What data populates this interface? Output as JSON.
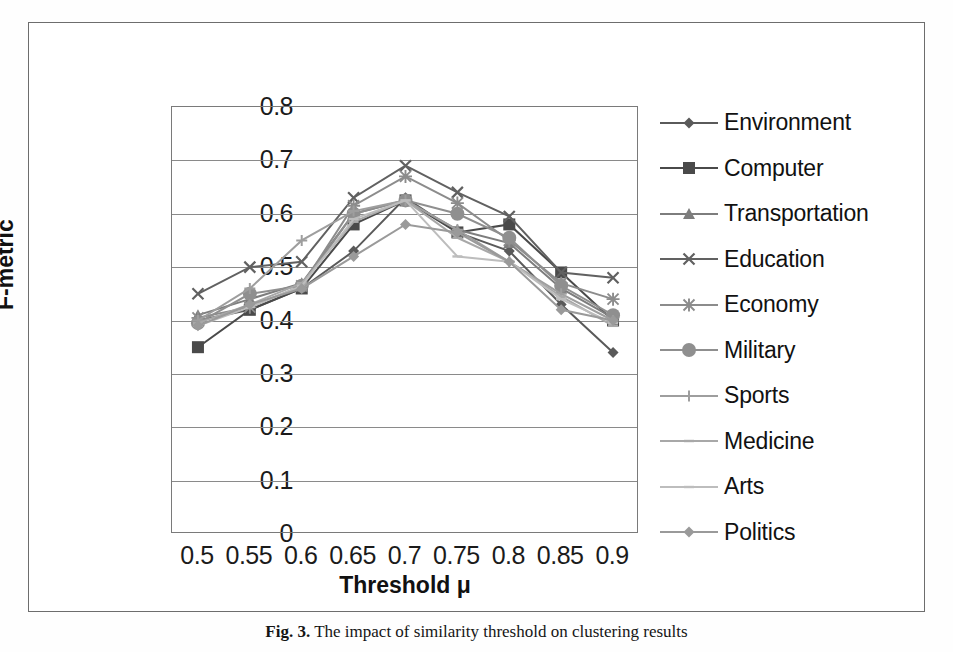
{
  "figure": {
    "caption_prefix": "Fig. 3.",
    "caption_text": "The impact of similarity threshold  on clustering results"
  },
  "chart_data": {
    "type": "line",
    "title": "",
    "xlabel": "Threshold μ",
    "ylabel": "F-metric",
    "categories": [
      "0.5",
      "0.55",
      "0.6",
      "0.65",
      "0.7",
      "0.75",
      "0.8",
      "0.85",
      "0.9"
    ],
    "x": [
      0.5,
      0.55,
      0.6,
      0.65,
      0.7,
      0.75,
      0.8,
      0.85,
      0.9
    ],
    "ylim": [
      0,
      0.8
    ],
    "yticks": [
      "0",
      "0.1",
      "0.2",
      "0.3",
      "0.4",
      "0.5",
      "0.6",
      "0.7",
      "0.8"
    ],
    "ytick_values": [
      0,
      0.1,
      0.2,
      0.3,
      0.4,
      0.5,
      0.6,
      0.7,
      0.8
    ],
    "grid": true,
    "legend_position": "right",
    "series": [
      {
        "name": "Environment",
        "marker": "diamond",
        "color": "#5a5a5a",
        "values": [
          0.4,
          0.42,
          0.46,
          0.53,
          0.63,
          0.565,
          0.53,
          0.43,
          0.34
        ]
      },
      {
        "name": "Computer",
        "marker": "square",
        "color": "#4a4a4a",
        "values": [
          0.35,
          0.42,
          0.46,
          0.58,
          0.625,
          0.565,
          0.58,
          0.49,
          0.4
        ]
      },
      {
        "name": "Transportation",
        "marker": "triangle",
        "color": "#7d7d7d",
        "values": [
          0.41,
          0.44,
          0.47,
          0.6,
          0.625,
          0.57,
          0.545,
          0.46,
          0.405
        ]
      },
      {
        "name": "Education",
        "marker": "cross",
        "color": "#616161",
        "values": [
          0.45,
          0.5,
          0.51,
          0.63,
          0.69,
          0.64,
          0.595,
          0.49,
          0.48
        ]
      },
      {
        "name": "Economy",
        "marker": "star",
        "color": "#8c8c8c",
        "values": [
          0.405,
          0.425,
          0.465,
          0.615,
          0.67,
          0.62,
          0.55,
          0.47,
          0.44
        ]
      },
      {
        "name": "Military",
        "marker": "circle",
        "color": "#8f8f8f",
        "values": [
          0.395,
          0.45,
          0.465,
          0.6,
          0.625,
          0.6,
          0.555,
          0.465,
          0.41
        ]
      },
      {
        "name": "Sports",
        "marker": "plus",
        "color": "#9e9e9e",
        "values": [
          0.4,
          0.46,
          0.55,
          0.605,
          0.625,
          0.57,
          0.51,
          0.45,
          0.4
        ]
      },
      {
        "name": "Medicine",
        "marker": "dash",
        "color": "#a8a8a8",
        "values": [
          0.395,
          0.43,
          0.47,
          0.585,
          0.625,
          0.555,
          0.51,
          0.445,
          0.39
        ]
      },
      {
        "name": "Arts",
        "marker": "dash",
        "color": "#bdbdbd",
        "values": [
          0.39,
          0.425,
          0.465,
          0.59,
          0.625,
          0.52,
          0.51,
          0.44,
          0.395
        ]
      },
      {
        "name": "Politics",
        "marker": "diamond",
        "color": "#9a9a9a",
        "values": [
          0.39,
          0.43,
          0.46,
          0.52,
          0.58,
          0.565,
          0.51,
          0.42,
          0.4
        ]
      }
    ]
  }
}
